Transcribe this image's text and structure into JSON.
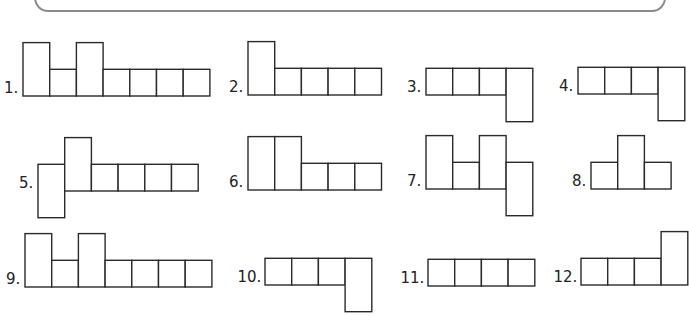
{
  "worksheet": {
    "stroke_color": "#2a2a2a",
    "frame_color": "#8a8a8a",
    "figures": [
      {
        "label": "1.",
        "cells": [
          {
            "col": 0,
            "row": 0,
            "h": 2
          },
          {
            "col": 1,
            "row": 0,
            "h": 1
          },
          {
            "col": 2,
            "row": 0,
            "h": 2
          },
          {
            "col": 3,
            "row": 0,
            "h": 1
          },
          {
            "col": 4,
            "row": 0,
            "h": 1
          },
          {
            "col": 5,
            "row": 0,
            "h": 1
          },
          {
            "col": 6,
            "row": 0,
            "h": 1
          }
        ]
      },
      {
        "label": "2.",
        "cells": [
          {
            "col": 0,
            "row": 0,
            "h": 2
          },
          {
            "col": 1,
            "row": 0,
            "h": 1
          },
          {
            "col": 2,
            "row": 0,
            "h": 1
          },
          {
            "col": 3,
            "row": 0,
            "h": 1
          },
          {
            "col": 4,
            "row": 0,
            "h": 1
          }
        ]
      },
      {
        "label": "3.",
        "cells": [
          {
            "col": 0,
            "row": 0,
            "h": 1
          },
          {
            "col": 1,
            "row": 0,
            "h": 1
          },
          {
            "col": 2,
            "row": 0,
            "h": 1
          },
          {
            "col": 3,
            "row": -1,
            "h": 2
          }
        ]
      },
      {
        "label": "4.",
        "cells": [
          {
            "col": 0,
            "row": 0,
            "h": 1
          },
          {
            "col": 1,
            "row": 0,
            "h": 1
          },
          {
            "col": 2,
            "row": 0,
            "h": 1
          },
          {
            "col": 3,
            "row": -1,
            "h": 2
          }
        ]
      },
      {
        "label": "5.",
        "cells": [
          {
            "col": 0,
            "row": -1,
            "h": 2
          },
          {
            "col": 1,
            "row": 0,
            "h": 2
          },
          {
            "col": 2,
            "row": 0,
            "h": 1
          },
          {
            "col": 3,
            "row": 0,
            "h": 1
          },
          {
            "col": 4,
            "row": 0,
            "h": 1
          },
          {
            "col": 5,
            "row": 0,
            "h": 1
          }
        ]
      },
      {
        "label": "6.",
        "cells": [
          {
            "col": 0,
            "row": 0,
            "h": 2
          },
          {
            "col": 1,
            "row": 0,
            "h": 2
          },
          {
            "col": 2,
            "row": 0,
            "h": 1
          },
          {
            "col": 3,
            "row": 0,
            "h": 1
          },
          {
            "col": 4,
            "row": 0,
            "h": 1
          }
        ]
      },
      {
        "label": "7.",
        "cells": [
          {
            "col": 0,
            "row": 0,
            "h": 2
          },
          {
            "col": 1,
            "row": 0,
            "h": 1
          },
          {
            "col": 2,
            "row": 0,
            "h": 2
          },
          {
            "col": 3,
            "row": -1,
            "h": 2
          }
        ]
      },
      {
        "label": "8.",
        "cells": [
          {
            "col": 0,
            "row": 0,
            "h": 1
          },
          {
            "col": 1,
            "row": 0,
            "h": 2
          },
          {
            "col": 2,
            "row": 0,
            "h": 1
          }
        ]
      },
      {
        "label": "9.",
        "cells": [
          {
            "col": 0,
            "row": 0,
            "h": 2
          },
          {
            "col": 1,
            "row": 0,
            "h": 1
          },
          {
            "col": 2,
            "row": 0,
            "h": 2
          },
          {
            "col": 3,
            "row": 0,
            "h": 1
          },
          {
            "col": 4,
            "row": 0,
            "h": 1
          },
          {
            "col": 5,
            "row": 0,
            "h": 1
          },
          {
            "col": 6,
            "row": 0,
            "h": 1
          }
        ]
      },
      {
        "label": "10.",
        "cells": [
          {
            "col": 0,
            "row": 0,
            "h": 1
          },
          {
            "col": 1,
            "row": 0,
            "h": 1
          },
          {
            "col": 2,
            "row": 0,
            "h": 1
          },
          {
            "col": 3,
            "row": -1,
            "h": 2
          }
        ]
      },
      {
        "label": "11.",
        "cells": [
          {
            "col": 0,
            "row": 0,
            "h": 1
          },
          {
            "col": 1,
            "row": 0,
            "h": 1
          },
          {
            "col": 2,
            "row": 0,
            "h": 1
          },
          {
            "col": 3,
            "row": 0,
            "h": 1
          }
        ]
      },
      {
        "label": "12.",
        "cells": [
          {
            "col": 0,
            "row": 0,
            "h": 1
          },
          {
            "col": 1,
            "row": 0,
            "h": 1
          },
          {
            "col": 2,
            "row": 0,
            "h": 1
          },
          {
            "col": 3,
            "row": 0,
            "h": 2
          }
        ]
      }
    ]
  }
}
